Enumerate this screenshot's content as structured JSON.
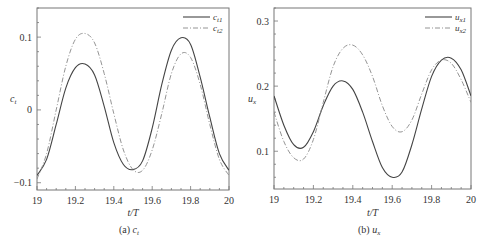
{
  "chart_data": [
    {
      "type": "line",
      "panel": "a",
      "caption": "(a)  c_t",
      "caption_prefix": "(a)",
      "caption_var": "c",
      "caption_sub": "t",
      "xlabel": "t/T",
      "ylabel": "c_t",
      "ylabel_var": "c",
      "ylabel_sub": "t",
      "xlim": [
        19,
        20
      ],
      "ylim": [
        -0.11,
        0.14
      ],
      "xticks": [
        19,
        19.2,
        19.4,
        19.6,
        19.8,
        20
      ],
      "xtick_labels": [
        "19",
        "19.2",
        "19.4",
        "19.6",
        "19.8",
        "20"
      ],
      "yticks": [
        -0.1,
        0,
        0.1
      ],
      "ytick_labels": [
        "−0.1",
        "0",
        "0.1"
      ],
      "grid": false,
      "legend_position": "upper right",
      "x": [
        19.0,
        19.05,
        19.1,
        19.15,
        19.2,
        19.25,
        19.3,
        19.35,
        19.4,
        19.45,
        19.5,
        19.55,
        19.6,
        19.65,
        19.7,
        19.75,
        19.8,
        19.85,
        19.9,
        19.95,
        20.0
      ],
      "series": [
        {
          "name": "c_t1",
          "label_var": "c",
          "label_sub": "t1",
          "style": "solid",
          "color": "#444444",
          "values": [
            -0.09,
            -0.068,
            -0.02,
            0.03,
            0.058,
            0.063,
            0.048,
            0.005,
            -0.045,
            -0.075,
            -0.082,
            -0.07,
            -0.025,
            0.035,
            0.082,
            0.099,
            0.09,
            0.045,
            -0.01,
            -0.06,
            -0.083
          ]
        },
        {
          "name": "c_t2",
          "label_var": "c",
          "label_sub": "t2",
          "style": "dashed",
          "color": "#888888",
          "values": [
            -0.095,
            -0.06,
            0.0,
            0.06,
            0.097,
            0.105,
            0.092,
            0.05,
            -0.005,
            -0.055,
            -0.082,
            -0.083,
            -0.055,
            -0.005,
            0.05,
            0.077,
            0.072,
            0.035,
            -0.02,
            -0.068,
            -0.09
          ]
        }
      ]
    },
    {
      "type": "line",
      "panel": "b",
      "caption": "(b)  u_x",
      "caption_prefix": "(b)",
      "caption_var": "u",
      "caption_sub": "x",
      "xlabel": "t/T",
      "ylabel": "u_x",
      "ylabel_var": "u",
      "ylabel_sub": "x",
      "xlim": [
        19,
        20
      ],
      "ylim": [
        0.042,
        0.32
      ],
      "xticks": [
        19,
        19.2,
        19.4,
        19.6,
        19.8,
        20
      ],
      "xtick_labels": [
        "19",
        "19.2",
        "19.4",
        "19.6",
        "19.8",
        "20"
      ],
      "yticks": [
        0.1,
        0.2,
        0.3
      ],
      "ytick_labels": [
        "0.1",
        "0.2",
        "0.3"
      ],
      "grid": false,
      "legend_position": "upper right",
      "x": [
        19.0,
        19.05,
        19.1,
        19.15,
        19.2,
        19.25,
        19.3,
        19.35,
        19.4,
        19.45,
        19.5,
        19.55,
        19.6,
        19.65,
        19.7,
        19.75,
        19.8,
        19.85,
        19.9,
        19.95,
        20.0
      ],
      "series": [
        {
          "name": "u_x1",
          "label_var": "u",
          "label_sub": "x1",
          "style": "solid",
          "color": "#444444",
          "values": [
            0.185,
            0.14,
            0.11,
            0.106,
            0.13,
            0.17,
            0.2,
            0.208,
            0.195,
            0.16,
            0.115,
            0.075,
            0.06,
            0.068,
            0.11,
            0.165,
            0.215,
            0.24,
            0.243,
            0.225,
            0.185
          ]
        },
        {
          "name": "u_x2",
          "label_var": "u",
          "label_sub": "x2",
          "style": "dashed",
          "color": "#888888",
          "values": [
            0.16,
            0.115,
            0.09,
            0.088,
            0.118,
            0.175,
            0.23,
            0.258,
            0.263,
            0.248,
            0.215,
            0.17,
            0.138,
            0.13,
            0.148,
            0.188,
            0.225,
            0.24,
            0.235,
            0.21,
            0.175
          ]
        }
      ]
    }
  ]
}
